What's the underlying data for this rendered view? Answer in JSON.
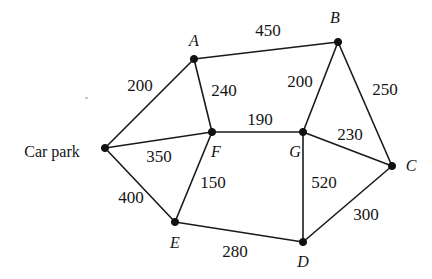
{
  "diagram": {
    "type": "weighted-undirected-graph",
    "title": "",
    "width": 432,
    "height": 279,
    "background_color": "#ffffff",
    "line_color": "#1a1a1a",
    "node_color": "#111111",
    "nodes": [
      {
        "id": "carpark",
        "label": "Car park",
        "x": 105,
        "y": 148,
        "label_x": 52,
        "label_y": 152,
        "label_style": "plain"
      },
      {
        "id": "A",
        "label": "A",
        "x": 194,
        "y": 59,
        "label_x": 194,
        "label_y": 41,
        "label_style": "italic"
      },
      {
        "id": "B",
        "label": "B",
        "x": 338,
        "y": 42,
        "label_x": 335,
        "label_y": 18,
        "label_style": "italic"
      },
      {
        "id": "C",
        "label": "C",
        "x": 392,
        "y": 166,
        "label_x": 411,
        "label_y": 166,
        "label_style": "italic"
      },
      {
        "id": "D",
        "label": "D",
        "x": 303,
        "y": 242,
        "label_x": 303,
        "label_y": 262,
        "label_style": "italic"
      },
      {
        "id": "E",
        "label": "E",
        "x": 175,
        "y": 222,
        "label_x": 175,
        "label_y": 243,
        "label_style": "italic"
      },
      {
        "id": "F",
        "label": "F",
        "x": 212,
        "y": 132,
        "label_x": 216,
        "label_y": 152,
        "label_style": "italic"
      },
      {
        "id": "G",
        "label": "G",
        "x": 303,
        "y": 132,
        "label_x": 295,
        "label_y": 152,
        "label_style": "italic"
      }
    ],
    "edges": [
      {
        "from": "carpark",
        "to": "A",
        "weight": 200,
        "label_x": 140,
        "label_y": 85
      },
      {
        "from": "A",
        "to": "B",
        "weight": 450,
        "label_x": 268,
        "label_y": 30
      },
      {
        "from": "A",
        "to": "F",
        "weight": 240,
        "label_x": 224,
        "label_y": 90
      },
      {
        "from": "B",
        "to": "G",
        "weight": 200,
        "label_x": 300,
        "label_y": 81
      },
      {
        "from": "B",
        "to": "C",
        "weight": 250,
        "label_x": 385,
        "label_y": 89
      },
      {
        "from": "carpark",
        "to": "F",
        "weight": 350,
        "label_x": 159,
        "label_y": 156
      },
      {
        "from": "carpark",
        "to": "E",
        "weight": 400,
        "label_x": 131,
        "label_y": 197
      },
      {
        "from": "F",
        "to": "G",
        "weight": 190,
        "label_x": 260,
        "label_y": 119
      },
      {
        "from": "F",
        "to": "E",
        "weight": 150,
        "label_x": 213,
        "label_y": 182
      },
      {
        "from": "G",
        "to": "C",
        "weight": 230,
        "label_x": 350,
        "label_y": 134
      },
      {
        "from": "G",
        "to": "D",
        "weight": 520,
        "label_x": 324,
        "label_y": 182
      },
      {
        "from": "C",
        "to": "D",
        "weight": 300,
        "label_x": 366,
        "label_y": 214
      },
      {
        "from": "E",
        "to": "D",
        "weight": 280,
        "label_x": 235,
        "label_y": 251
      }
    ]
  }
}
